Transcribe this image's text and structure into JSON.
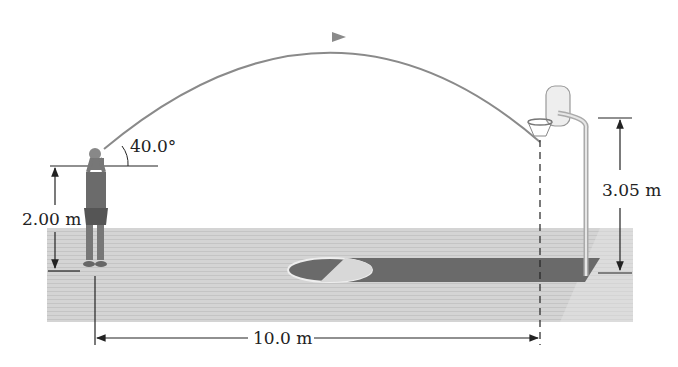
{
  "figure": {
    "type": "projectile-motion-diagram"
  },
  "labels": {
    "launch_angle": "40.0°",
    "release_height": "2.00 m",
    "hoop_height": "3.05 m",
    "horizontal_distance": "10.0 m"
  },
  "colors": {
    "trajectory": "#8a8a8a",
    "court_floor": "#d6d6d6",
    "key_area": "#6e6e6e",
    "dimension_lines": "#222222"
  }
}
